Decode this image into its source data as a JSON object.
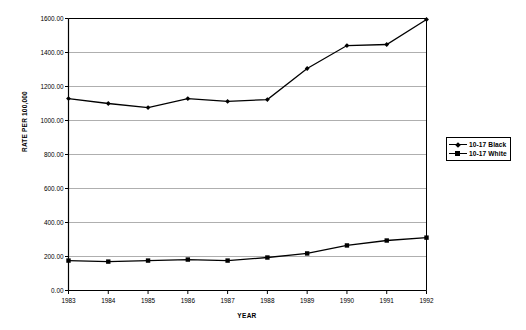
{
  "chart_data": {
    "type": "line",
    "title": "",
    "xlabel": "YEAR",
    "ylabel": "RATE PER 100,000",
    "categories": [
      "1983",
      "1984",
      "1985",
      "1986",
      "1987",
      "1988",
      "1989",
      "1990",
      "1991",
      "1992"
    ],
    "x": [
      1983,
      1984,
      1985,
      1986,
      1987,
      1988,
      1989,
      1990,
      1991,
      1992
    ],
    "xlim": [
      1983,
      1992
    ],
    "ylim": [
      0,
      1600
    ],
    "ytick_values": [
      0,
      200,
      400,
      600,
      800,
      1000,
      1200,
      1400,
      1600
    ],
    "ytick_labels": [
      "0.00",
      "200.00",
      "400.00",
      "600.00",
      "800.00",
      "1000.00",
      "1200.00",
      "1400.00",
      "1600.00"
    ],
    "grid": true,
    "grid_axis": "y",
    "legend_position": "right outside",
    "series": [
      {
        "name": "10-17 Black",
        "marker": "diamond",
        "color": "#000000",
        "values": [
          1129,
          1100,
          1076,
          1129,
          1112,
          1123,
          1306,
          1441,
          1447,
          1594
        ]
      },
      {
        "name": "10-17 White",
        "marker": "square",
        "color": "#000000",
        "values": [
          176,
          170,
          176,
          182,
          176,
          194,
          218,
          265,
          294,
          311
        ]
      }
    ]
  },
  "legend": {
    "entries": [
      {
        "label": "10-17 Black"
      },
      {
        "label": "10-17 White"
      }
    ]
  },
  "colors": {
    "line": "#000000",
    "grid": "#9a9a9a",
    "axis": "#000000",
    "background": "#ffffff"
  }
}
